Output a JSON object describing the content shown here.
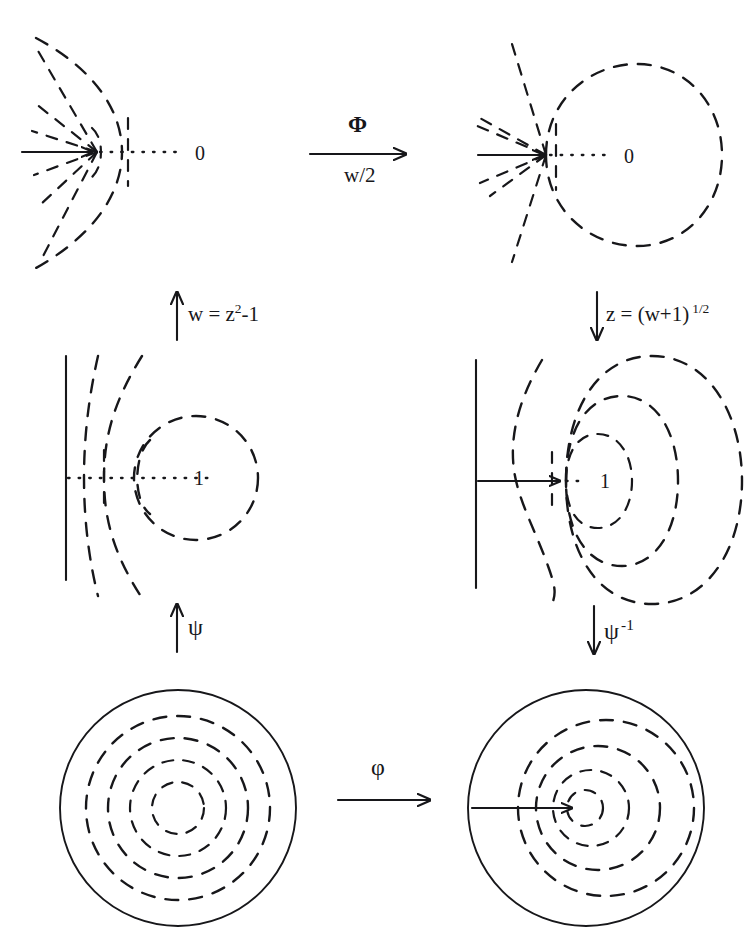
{
  "figure": {
    "type": "diagram",
    "background_color": "#ffffff",
    "ink_color": "#17171a"
  },
  "panels": {
    "top_left": {
      "name": "z-plane with slit / point charge at origin",
      "center_label": "0",
      "features": "radial dashed field lines converging to a cusp at left, dashed open equipotential arc, dotted horizontal axis, solid horizontal arrow from left"
    },
    "top_right": {
      "name": "w-plane, closed dashed circle equipotential",
      "center_label": "0",
      "features": "radial dashed field lines from a cusp, large closed dashed circle, dotted horizontal axis, solid horizontal arrow from left"
    },
    "middle_left": {
      "name": "half-plane with dashed equipotential circle about 1",
      "center_label": "1",
      "features": "solid vertical boundary line at left, dashed field curves, dashed circle, dotted horizontal axis"
    },
    "middle_right": {
      "name": "half-plane with nested dashed equipotentials about 1",
      "center_label": "1",
      "features": "solid vertical boundary line, solid horizontal arrow to a cusp, three nested dashed closed curves"
    },
    "bottom_left": {
      "name": "unit disc with concentric dashed circles",
      "center_label": "",
      "features": "solid outer circle, four concentric dashed circles, centered"
    },
    "bottom_right": {
      "name": "unit disc with off-centre dashed circles",
      "center_label": "",
      "features": "solid outer circle, four off-centre nested dashed circles, solid horizontal arrow from left edge to the off-centre focus"
    }
  },
  "arrows": {
    "top_horizontal": {
      "direction": "right",
      "label_above": "Φ",
      "label_below": "w/2"
    },
    "left_vertical": {
      "direction": "up",
      "label": "w = z",
      "label_sup": "2",
      "label_tail": "-1"
    },
    "right_vertical": {
      "direction": "down",
      "label": "z = (w+1)",
      "label_sup": "1/2"
    },
    "left_vertical_lower": {
      "direction": "up",
      "label": "ψ"
    },
    "right_vertical_lower": {
      "direction": "down",
      "label": "ψ",
      "label_sup": "-1"
    },
    "bottom_horizontal": {
      "direction": "right",
      "label_above": "φ"
    }
  },
  "labels": {
    "zero_top_left": "0",
    "zero_top_right": "0",
    "one_middle_left": "1",
    "one_middle_right": "1"
  }
}
